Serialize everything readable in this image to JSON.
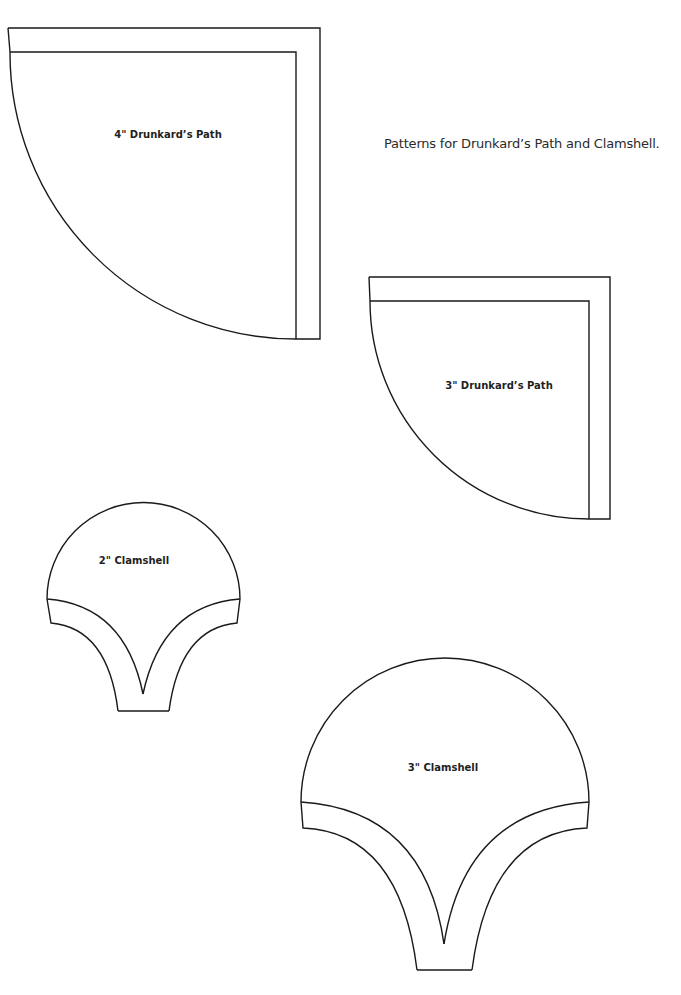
{
  "caption": "Patterns for Drunkard’s Path and Clamshell.",
  "patterns": [
    {
      "id": "drunkards-path-4",
      "label": "4\" Drunkard’s Path"
    },
    {
      "id": "drunkards-path-3",
      "label": "3\" Drunkard’s Path"
    },
    {
      "id": "clamshell-2",
      "label": "2\" Clamshell"
    },
    {
      "id": "clamshell-3",
      "label": "3\" Clamshell"
    }
  ]
}
